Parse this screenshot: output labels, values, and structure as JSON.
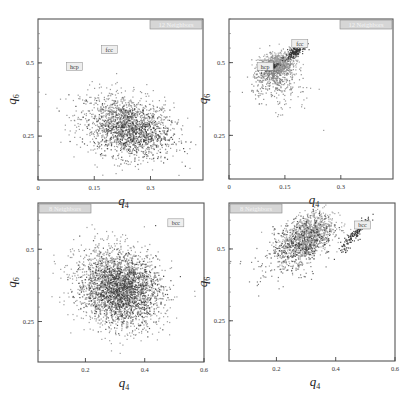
{
  "figure": {
    "panels": 4,
    "layout": "2x2"
  },
  "chart_data": [
    {
      "type": "scatter",
      "panel": "top-left",
      "title": "12 Neighbors",
      "xlabel": "q4",
      "ylabel": "q6",
      "xlim": [
        0,
        0.44
      ],
      "ylim": [
        0.1,
        0.65
      ],
      "xticks": [
        {
          "v": 0,
          "label": "0"
        },
        {
          "v": 0.15,
          "label": "0.15"
        },
        {
          "v": 0.3,
          "label": "0.3"
        }
      ],
      "yticks": [
        {
          "v": 0.25,
          "label": "0.25"
        },
        {
          "v": 0.5,
          "label": "0.5"
        }
      ],
      "box": [
        38,
        19,
        203,
        180
      ],
      "annotations": [
        {
          "text": "fcc",
          "x": 0.19,
          "y": 0.542
        },
        {
          "text": "hcp",
          "x": 0.097,
          "y": 0.485
        }
      ],
      "clusters": [
        {
          "n": 1400,
          "cx": 0.235,
          "cy": 0.285,
          "sx": 0.062,
          "sy": 0.055,
          "rho": -0.25,
          "color": "#8a8a8a"
        },
        {
          "n": 500,
          "cx": 0.25,
          "cy": 0.27,
          "sx": 0.05,
          "sy": 0.045,
          "rho": -0.2,
          "color": "#3a3a3a"
        }
      ]
    },
    {
      "type": "scatter",
      "panel": "top-right",
      "title": "12 Neighbors",
      "xlabel": "q4",
      "ylabel": "q6",
      "xlim": [
        0,
        0.44
      ],
      "ylim": [
        0.1,
        0.65
      ],
      "xticks": [
        {
          "v": 0,
          "label": "0"
        },
        {
          "v": 0.15,
          "label": "0.15"
        },
        {
          "v": 0.3,
          "label": "0.3"
        }
      ],
      "yticks": [
        {
          "v": 0.25,
          "label": "0.25"
        },
        {
          "v": 0.5,
          "label": "0.5"
        }
      ],
      "box": [
        229,
        19,
        393,
        179
      ],
      "annotations": [
        {
          "text": "fcc",
          "x": 0.19,
          "y": 0.562
        },
        {
          "text": "hcp",
          "x": 0.097,
          "y": 0.484
        }
      ],
      "clusters": [
        {
          "n": 700,
          "cx": 0.125,
          "cy": 0.495,
          "sx": 0.022,
          "sy": 0.02,
          "rho": 0.3,
          "color": "#9a9a9a"
        },
        {
          "n": 350,
          "cx": 0.12,
          "cy": 0.45,
          "sx": 0.03,
          "sy": 0.035,
          "rho": 0.2,
          "color": "#7a7a7a"
        },
        {
          "n": 180,
          "cx": 0.175,
          "cy": 0.54,
          "sx": 0.012,
          "sy": 0.012,
          "rho": 0.6,
          "color": "#333333"
        },
        {
          "n": 90,
          "cx": 0.11,
          "cy": 0.485,
          "sx": 0.01,
          "sy": 0.006,
          "rho": 0.7,
          "color": "#2a2a2a"
        },
        {
          "n": 60,
          "cx": 0.15,
          "cy": 0.39,
          "sx": 0.04,
          "sy": 0.04,
          "rho": 0.0,
          "color": "#8a8a8a"
        }
      ]
    },
    {
      "type": "scatter",
      "panel": "bottom-left",
      "title": "8 Neighbors",
      "xlabel": "q4",
      "ylabel": "q6",
      "xlim": [
        0.04,
        0.6
      ],
      "ylim": [
        0.11,
        0.66
      ],
      "xticks": [
        {
          "v": 0.2,
          "label": "0.2"
        },
        {
          "v": 0.4,
          "label": "0.4"
        },
        {
          "v": 0.6,
          "label": "0.6"
        }
      ],
      "yticks": [
        {
          "v": 0.25,
          "label": "0.25"
        },
        {
          "v": 0.5,
          "label": "0.5"
        }
      ],
      "box": [
        38,
        203,
        204,
        362
      ],
      "annotations": [
        {
          "text": "bcc",
          "x": 0.505,
          "y": 0.588
        }
      ],
      "clusters": [
        {
          "n": 2200,
          "cx": 0.31,
          "cy": 0.37,
          "sx": 0.072,
          "sy": 0.068,
          "rho": -0.15,
          "color": "#8e8e8e"
        },
        {
          "n": 900,
          "cx": 0.32,
          "cy": 0.36,
          "sx": 0.06,
          "sy": 0.055,
          "rho": -0.1,
          "color": "#3c3c3c"
        }
      ]
    },
    {
      "type": "scatter",
      "panel": "bottom-right",
      "title": "8 Neighbors",
      "xlabel": "q4",
      "ylabel": "q6",
      "xlim": [
        0.04,
        0.6
      ],
      "ylim": [
        0.11,
        0.66
      ],
      "xticks": [
        {
          "v": 0.2,
          "label": "0.2"
        },
        {
          "v": 0.4,
          "label": "0.4"
        },
        {
          "v": 0.6,
          "label": "0.6"
        }
      ],
      "yticks": [
        {
          "v": 0.25,
          "label": "0.25"
        },
        {
          "v": 0.5,
          "label": "0.5"
        }
      ],
      "box": [
        229,
        203,
        395,
        361
      ],
      "annotations": [
        {
          "text": "bcc",
          "x": 0.49,
          "y": 0.58
        }
      ],
      "clusters": [
        {
          "n": 1100,
          "cx": 0.3,
          "cy": 0.545,
          "sx": 0.045,
          "sy": 0.042,
          "rho": 0.45,
          "color": "#999999"
        },
        {
          "n": 300,
          "cx": 0.29,
          "cy": 0.53,
          "sx": 0.05,
          "sy": 0.045,
          "rho": 0.4,
          "color": "#3a3a3a"
        },
        {
          "n": 120,
          "cx": 0.22,
          "cy": 0.46,
          "sx": 0.06,
          "sy": 0.05,
          "rho": 0.3,
          "color": "#6a6a6a"
        },
        {
          "n": 140,
          "cx": 0.465,
          "cy": 0.555,
          "sx": 0.025,
          "sy": 0.03,
          "rho": 0.92,
          "color": "#2a2a2a"
        }
      ]
    }
  ]
}
